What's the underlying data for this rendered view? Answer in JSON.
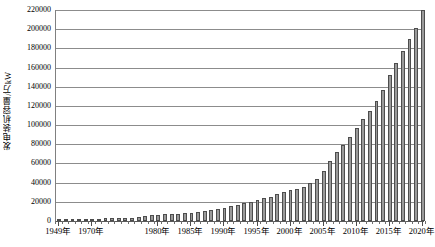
{
  "chart_data": {
    "type": "bar",
    "title": "",
    "subtitle": "",
    "xlabel": "",
    "ylabel": "发电装机容量/万kW",
    "ylim": [
      0,
      220000
    ],
    "ytick_interval": 20000,
    "ytick_labels": [
      "0",
      "20000",
      "40000",
      "60000",
      "80000",
      "100000",
      "120000",
      "140000",
      "160000",
      "180000",
      "200000",
      "220000"
    ],
    "ytick_values": [
      0,
      20000,
      40000,
      60000,
      80000,
      100000,
      120000,
      140000,
      160000,
      180000,
      200000,
      220000
    ],
    "xtick_labels": [
      "1949年",
      "1970年",
      "1980年",
      "1985年",
      "1990年",
      "1995年",
      "2000年",
      "2005年",
      "2010年",
      "2015年",
      "2020年"
    ],
    "xtick_years": [
      1949,
      1970,
      1980,
      1985,
      1990,
      1995,
      2000,
      2005,
      2010,
      2015,
      2020
    ],
    "grid": true,
    "grid_axis": "y",
    "legend": false,
    "legend_position": "none",
    "bar_color": "#9a9a9a",
    "bar_edge_color": "#4d4d4d",
    "axis_color": "#808080",
    "categories": [
      "1949年",
      "1952年",
      "1957年",
      "1962年",
      "1965年",
      "1970年",
      "1971年",
      "1972年",
      "1973年",
      "1974年",
      "1975年",
      "1976年",
      "1977年",
      "1978年",
      "1979年",
      "1980年",
      "1981年",
      "1982年",
      "1983年",
      "1984年",
      "1985年",
      "1986年",
      "1987年",
      "1988年",
      "1989年",
      "1990年",
      "1991年",
      "1992年",
      "1993年",
      "1994年",
      "1995年",
      "1996年",
      "1997年",
      "1998年",
      "1999年",
      "2000年",
      "2001年",
      "2002年",
      "2003年",
      "2004年",
      "2005年",
      "2006年",
      "2007年",
      "2008年",
      "2009年",
      "2010年",
      "2011年",
      "2012年",
      "2013年",
      "2014年",
      "2015年",
      "2016年",
      "2017年",
      "2018年",
      "2019年",
      "2020年"
    ],
    "values": [
      185,
      285,
      465,
      1300,
      1500,
      2377,
      2600,
      2800,
      3000,
      3200,
      3400,
      3600,
      3900,
      5712,
      6300,
      6587,
      6913,
      7236,
      7644,
      8012,
      8705,
      9382,
      10290,
      11550,
      12664,
      13789,
      15147,
      16653,
      18291,
      19990,
      21722,
      23654,
      25424,
      27729,
      29877,
      31932,
      33849,
      35657,
      39141,
      44239,
      51718,
      62370,
      71822,
      79273,
      87410,
      96641,
      106253,
      114676,
      124738,
      137018,
      152527,
      164575,
      177703,
      189967,
      201066,
      220058
    ],
    "units": "万kW",
    "value_axis_max_bar": 220058,
    "value_axis_min_bar": 185,
    "note": "中国历年发电装机容量"
  }
}
